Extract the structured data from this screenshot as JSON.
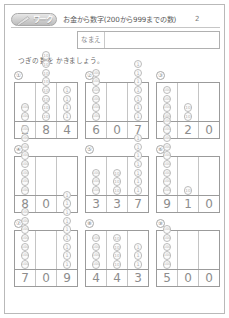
{
  "header": {
    "badge_label": "ワーク",
    "badge_icon": "pencil-icon",
    "title": "お金から数字(200から999までの数)",
    "sheet_number": "2"
  },
  "name_field": {
    "label": "なまえ",
    "value": "",
    "placeholder": ""
  },
  "instruction": "つぎの 数を かきましょう。",
  "coin_glyphs": {
    "hundred": "100",
    "ten": "10",
    "one": "1"
  },
  "problems": [
    {
      "number": "①",
      "coins": {
        "hundred": 2,
        "ten": 8,
        "one": 4
      },
      "answer": [
        "2",
        "8",
        "4"
      ]
    },
    {
      "number": "②",
      "coins": {
        "hundred": 6,
        "ten": 0,
        "one": 7
      },
      "answer": [
        "6",
        "0",
        "7"
      ]
    },
    {
      "number": "③",
      "coins": {
        "hundred": 4,
        "ten": 2,
        "one": 0
      },
      "answer": [
        "4",
        "2",
        "0"
      ]
    },
    {
      "number": "④",
      "coins": {
        "hundred": 8,
        "ten": 0,
        "one": 0
      },
      "answer": [
        "8",
        "0",
        "0"
      ]
    },
    {
      "number": "⑤",
      "coins": {
        "hundred": 3,
        "ten": 3,
        "one": 7
      },
      "answer": [
        "3",
        "3",
        "7"
      ]
    },
    {
      "number": "⑥",
      "coins": {
        "hundred": 9,
        "ten": 1,
        "one": 0
      },
      "answer": [
        "9",
        "1",
        "0"
      ]
    },
    {
      "number": "⑦",
      "coins": {
        "hundred": 7,
        "ten": 0,
        "one": 9
      },
      "answer": [
        "7",
        "0",
        "9"
      ]
    },
    {
      "number": "⑧",
      "coins": {
        "hundred": 4,
        "ten": 4,
        "one": 3
      },
      "answer": [
        "4",
        "4",
        "3"
      ]
    },
    {
      "number": "⑨",
      "coins": {
        "hundred": 5,
        "ten": 0,
        "one": 0
      },
      "answer": [
        "5",
        "0",
        "0"
      ]
    }
  ]
}
